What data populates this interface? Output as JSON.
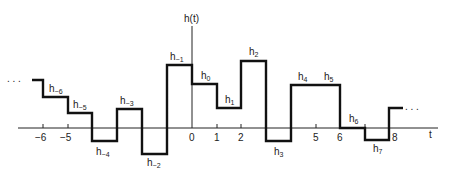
{
  "figure": {
    "y_axis_label": "h(t)",
    "x_axis_label": "t",
    "ellipsis_left": ". . .",
    "ellipsis_right": ". . .",
    "tick_labels": [
      {
        "t": -6,
        "label": "−6"
      },
      {
        "t": -5,
        "label": "−5"
      },
      {
        "t": 0,
        "label": "0"
      },
      {
        "t": 1,
        "label": "1"
      },
      {
        "t": 2,
        "label": "2"
      },
      {
        "t": 5,
        "label": "5"
      },
      {
        "t": 6,
        "label": "6"
      },
      {
        "t": 8,
        "label": "8"
      }
    ],
    "segment_labels": [
      {
        "base": "h",
        "sub": "−6"
      },
      {
        "base": "h",
        "sub": "−5"
      },
      {
        "base": "h",
        "sub": "−4"
      },
      {
        "base": "h",
        "sub": "−3"
      },
      {
        "base": "h",
        "sub": "−2"
      },
      {
        "base": "h",
        "sub": "−1"
      },
      {
        "base": "h",
        "sub": "0"
      },
      {
        "base": "h",
        "sub": "1"
      },
      {
        "base": "h",
        "sub": "2"
      },
      {
        "base": "h",
        "sub": "3"
      },
      {
        "base": "h",
        "sub": "4"
      },
      {
        "base": "h",
        "sub": "5"
      },
      {
        "base": "h",
        "sub": "6"
      },
      {
        "base": "h",
        "sub": "7"
      }
    ],
    "line_color": "#111111"
  }
}
